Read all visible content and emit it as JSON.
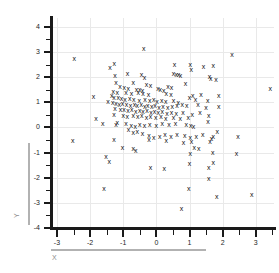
{
  "chart_data": {
    "type": "scatter",
    "title": "",
    "xlabel": "X",
    "ylabel": "Y",
    "xlim": [
      -3.15,
      3.55
    ],
    "ylim": [
      -4.0,
      4.35
    ],
    "xticks": [
      -3,
      -2,
      -1,
      0,
      1,
      2,
      3
    ],
    "yticks": [
      -4,
      -3,
      -2,
      -1,
      0,
      1,
      2,
      3,
      4
    ],
    "xticklabels": [
      "-3",
      "-2",
      "-1",
      "0",
      "1",
      "2",
      "3"
    ],
    "yticklabels": [
      "-4",
      "-3",
      "-2",
      "-1",
      "0",
      "1",
      "2",
      "3",
      "4"
    ],
    "xminor_step": 0.5,
    "yminor_step": 0.5,
    "grid": true,
    "grid_color": "#e9e9e9",
    "marker": "x",
    "marker_glyph": "x",
    "marker_color": "#111111",
    "legend": null,
    "n_points": 182,
    "points": [
      [
        -0.38,
        3.14
      ],
      [
        2.28,
        2.88
      ],
      [
        -2.48,
        2.75
      ],
      [
        -1.27,
        2.56
      ],
      [
        0.55,
        2.52
      ],
      [
        1.02,
        2.5
      ],
      [
        1.72,
        2.46
      ],
      [
        1.42,
        2.44
      ],
      [
        -1.4,
        2.4
      ],
      [
        1.05,
        2.31
      ],
      [
        -0.87,
        2.13
      ],
      [
        -0.45,
        2.11
      ],
      [
        0.52,
        2.15
      ],
      [
        0.6,
        2.12
      ],
      [
        0.67,
        2.1
      ],
      [
        0.73,
        2.08
      ],
      [
        1.6,
        2.02
      ],
      [
        1.64,
        1.96
      ],
      [
        -1.25,
        2.05
      ],
      [
        -0.36,
        1.97
      ],
      [
        1.8,
        1.91
      ],
      [
        -1.22,
        1.8
      ],
      [
        -0.7,
        1.78
      ],
      [
        -0.3,
        1.72
      ],
      [
        -0.18,
        1.66
      ],
      [
        0.88,
        1.74
      ],
      [
        0.35,
        1.63
      ],
      [
        0.46,
        1.6
      ],
      [
        -1.1,
        1.62
      ],
      [
        -0.97,
        1.58
      ],
      [
        -0.85,
        1.55
      ],
      [
        -0.6,
        1.52
      ],
      [
        -0.5,
        1.5
      ],
      [
        -0.42,
        1.46
      ],
      [
        0.05,
        1.55
      ],
      [
        0.12,
        1.5
      ],
      [
        0.22,
        1.46
      ],
      [
        -1.3,
        1.42
      ],
      [
        -1.18,
        1.38
      ],
      [
        -0.92,
        1.4
      ],
      [
        -0.75,
        1.36
      ],
      [
        -0.55,
        1.38
      ],
      [
        -0.4,
        1.34
      ],
      [
        -0.24,
        1.32
      ],
      [
        0.3,
        1.35
      ],
      [
        0.44,
        1.3
      ],
      [
        1.1,
        1.28
      ],
      [
        1.35,
        1.3
      ],
      [
        1.88,
        1.25
      ],
      [
        -1.9,
        1.22
      ],
      [
        -1.35,
        1.28
      ],
      [
        -1.28,
        1.2
      ],
      [
        -1.15,
        1.18
      ],
      [
        -1.05,
        1.14
      ],
      [
        -0.95,
        1.12
      ],
      [
        -0.8,
        1.15
      ],
      [
        -0.68,
        1.1
      ],
      [
        -0.52,
        1.08
      ],
      [
        -0.34,
        1.12
      ],
      [
        -0.2,
        1.06
      ],
      [
        -0.08,
        1.1
      ],
      [
        0.02,
        1.04
      ],
      [
        0.16,
        1.08
      ],
      [
        0.28,
        1.02
      ],
      [
        0.52,
        1.05
      ],
      [
        0.66,
        1.0
      ],
      [
        1.0,
        1.2
      ],
      [
        1.18,
        1.12
      ],
      [
        1.55,
        1.05
      ],
      [
        -1.46,
        1.02
      ],
      [
        -1.32,
        0.98
      ],
      [
        -1.22,
        0.96
      ],
      [
        -1.12,
        0.92
      ],
      [
        -1.02,
        0.95
      ],
      [
        -0.9,
        0.9
      ],
      [
        -0.78,
        0.88
      ],
      [
        -0.66,
        0.92
      ],
      [
        -0.58,
        0.86
      ],
      [
        -0.46,
        0.9
      ],
      [
        -0.35,
        0.84
      ],
      [
        -0.26,
        0.88
      ],
      [
        -0.14,
        0.82
      ],
      [
        -0.04,
        0.86
      ],
      [
        0.08,
        0.8
      ],
      [
        0.2,
        0.84
      ],
      [
        0.34,
        0.78
      ],
      [
        0.48,
        0.82
      ],
      [
        0.62,
        0.88
      ],
      [
        0.78,
        0.92
      ],
      [
        0.92,
        0.86
      ],
      [
        1.26,
        0.9
      ],
      [
        1.5,
        0.78
      ],
      [
        -1.25,
        0.74
      ],
      [
        -1.08,
        0.7
      ],
      [
        -0.98,
        0.72
      ],
      [
        -0.86,
        0.66
      ],
      [
        -0.74,
        0.7
      ],
      [
        -0.62,
        0.64
      ],
      [
        -0.5,
        0.68
      ],
      [
        -0.4,
        0.62
      ],
      [
        -0.28,
        0.66
      ],
      [
        -0.16,
        0.6
      ],
      [
        -0.06,
        0.64
      ],
      [
        0.06,
        0.58
      ],
      [
        0.18,
        0.62
      ],
      [
        0.32,
        0.56
      ],
      [
        0.46,
        0.6
      ],
      [
        0.6,
        0.54
      ],
      [
        0.8,
        0.58
      ],
      [
        1.08,
        0.52
      ],
      [
        1.32,
        0.6
      ],
      [
        1.58,
        0.48
      ],
      [
        -1.28,
        0.52
      ],
      [
        -1.0,
        0.48
      ],
      [
        -0.88,
        0.44
      ],
      [
        -0.7,
        0.46
      ],
      [
        -0.56,
        0.42
      ],
      [
        -0.44,
        0.46
      ],
      [
        -0.3,
        0.4
      ],
      [
        -0.18,
        0.44
      ],
      [
        -0.02,
        0.38
      ],
      [
        0.14,
        0.42
      ],
      [
        0.28,
        0.36
      ],
      [
        0.52,
        0.4
      ],
      [
        0.72,
        0.34
      ],
      [
        0.96,
        0.38
      ],
      [
        -1.22,
        0.12
      ],
      [
        -1.18,
        0.2
      ],
      [
        -0.92,
        0.14
      ],
      [
        -0.76,
        0.08
      ],
      [
        -0.64,
        0.04
      ],
      [
        -0.5,
        0.1
      ],
      [
        -0.36,
        0.06
      ],
      [
        -0.2,
        0.12
      ],
      [
        0.0,
        0.08
      ],
      [
        0.18,
        0.14
      ],
      [
        0.38,
        0.1
      ],
      [
        0.58,
        0.16
      ],
      [
        0.9,
        0.12
      ],
      [
        1.04,
        0.06
      ],
      [
        1.12,
        0.04
      ],
      [
        1.56,
        0.22
      ],
      [
        -1.62,
        0.16
      ],
      [
        -1.82,
        0.34
      ],
      [
        -0.84,
        -0.1
      ],
      [
        -0.7,
        -0.22
      ],
      [
        -0.58,
        -0.18
      ],
      [
        -0.42,
        -0.26
      ],
      [
        -0.22,
        -0.32
      ],
      [
        -0.08,
        -0.4
      ],
      [
        0.1,
        -0.36
      ],
      [
        0.26,
        -0.3
      ],
      [
        0.44,
        -0.38
      ],
      [
        0.62,
        -0.28
      ],
      [
        0.86,
        -0.34
      ],
      [
        1.02,
        -0.42
      ],
      [
        1.2,
        -0.36
      ],
      [
        1.4,
        -0.3
      ],
      [
        1.66,
        -0.44
      ],
      [
        1.72,
        -0.38
      ],
      [
        1.84,
        -0.18
      ],
      [
        2.46,
        -0.38
      ],
      [
        -2.52,
        -0.52
      ],
      [
        -1.28,
        -0.48
      ],
      [
        -0.22,
        -0.5
      ],
      [
        0.3,
        -0.52
      ],
      [
        1.06,
        -0.56
      ],
      [
        1.62,
        -0.58
      ],
      [
        0.82,
        -0.62
      ],
      [
        1.14,
        -0.8
      ],
      [
        1.28,
        -0.82
      ],
      [
        -1.02,
        -0.8
      ],
      [
        -0.7,
        -0.84
      ],
      [
        -0.62,
        -0.9
      ],
      [
        1.02,
        -1.02
      ],
      [
        1.7,
        -0.98
      ],
      [
        2.42,
        -1.04
      ],
      [
        -1.52,
        -1.14
      ],
      [
        -1.42,
        -1.36
      ],
      [
        1.72,
        -1.38
      ],
      [
        1.0,
        -1.42
      ],
      [
        -0.18,
        -1.58
      ],
      [
        0.24,
        -1.64
      ],
      [
        1.58,
        -1.58
      ],
      [
        1.58,
        -2.02
      ],
      [
        0.98,
        -2.42
      ],
      [
        -1.58,
        -2.44
      ],
      [
        1.82,
        -2.76
      ],
      [
        2.88,
        -2.66
      ],
      [
        0.76,
        -3.22
      ],
      [
        3.44,
        1.54
      ],
      [
        1.88,
        0.82
      ]
    ]
  },
  "axes": {
    "y_title": "Y",
    "x_title": "X"
  }
}
